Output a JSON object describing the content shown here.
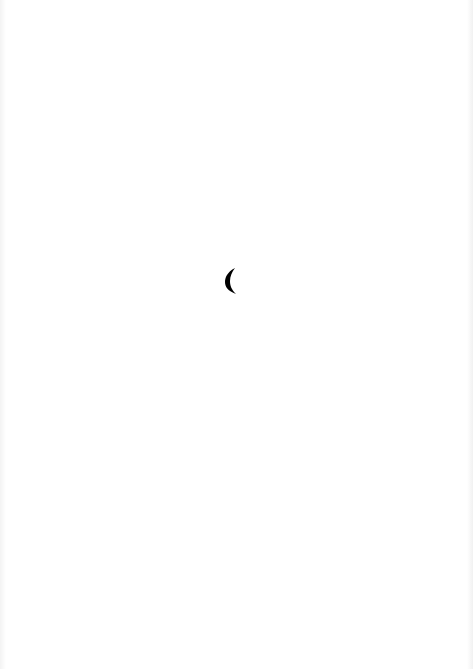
{
  "page": {
    "background": "#ffffff",
    "glyph": {
      "icon": "crescent-parenthesis-icon",
      "color": "#000000"
    }
  }
}
